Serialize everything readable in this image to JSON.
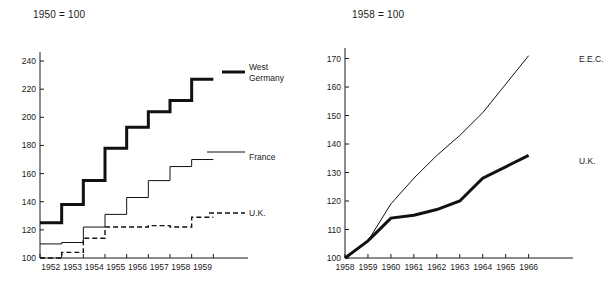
{
  "chart_data": [
    {
      "id": "left",
      "type": "line",
      "subtype": "step",
      "title": "1950 = 100",
      "xlabel": "",
      "ylabel": "",
      "x": [
        1952,
        1953,
        1954,
        1955,
        1956,
        1957,
        1958,
        1959
      ],
      "xtick_labels": [
        "1952",
        "1953",
        "1954",
        "1955",
        "1956",
        "1957",
        "1958",
        "1959"
      ],
      "ytick_labels": [
        "240",
        "220",
        "200",
        "180",
        "160",
        "140",
        "120",
        "100"
      ],
      "yticks": [
        240,
        220,
        200,
        180,
        160,
        140,
        120,
        100
      ],
      "xlim": [
        1951.5,
        1959.9
      ],
      "ylim": [
        100,
        245
      ],
      "grid": false,
      "legend_position": "right-inline",
      "series": [
        {
          "name": "West Germany",
          "label": "West Germany",
          "style": "thick-solid",
          "values": [
            125,
            138,
            155,
            178,
            193,
            204,
            212,
            227
          ]
        },
        {
          "name": "France",
          "label": "France",
          "style": "thin-solid",
          "values": [
            110,
            111,
            122,
            131,
            143,
            155,
            165,
            170
          ]
        },
        {
          "name": "U.K.",
          "label": "U.K.",
          "style": "dashed",
          "values": [
            100,
            104,
            114,
            122,
            122,
            123,
            122,
            129
          ]
        }
      ]
    },
    {
      "id": "right",
      "type": "line",
      "subtype": "line",
      "title": "1958 = 100",
      "xlabel": "",
      "ylabel": "",
      "x": [
        1958,
        1959,
        1960,
        1961,
        1962,
        1963,
        1964,
        1965,
        1966
      ],
      "xtick_labels": [
        "1958",
        "1959",
        "1960",
        "1961",
        "1962",
        "1963",
        "1964",
        "1965",
        "1966"
      ],
      "ytick_labels": [
        "170",
        "160",
        "150",
        "140",
        "130",
        "120",
        "110",
        "100"
      ],
      "yticks": [
        170,
        160,
        150,
        140,
        130,
        120,
        110,
        100
      ],
      "xlim": [
        1958,
        1966.8
      ],
      "ylim": [
        100,
        173
      ],
      "grid": false,
      "legend_position": "right-inline",
      "series": [
        {
          "name": "E.E.C.",
          "label": "E.E.C.",
          "style": "thin-solid",
          "values": [
            100,
            106,
            119,
            128,
            136,
            143,
            151,
            161,
            171
          ]
        },
        {
          "name": "U.K.",
          "label": "U.K.",
          "style": "thick-solid",
          "values": [
            100,
            106,
            114,
            115,
            117,
            120,
            128,
            132,
            136
          ]
        }
      ]
    }
  ],
  "left": {
    "title": "1950 = 100",
    "labels": {
      "west_germany_line1": "West",
      "west_germany_line2": "Germany",
      "france": "France",
      "uk": "U.K."
    }
  },
  "right": {
    "title": "1958 = 100",
    "labels": {
      "eec": "E.E.C.",
      "uk": "U.K."
    }
  }
}
